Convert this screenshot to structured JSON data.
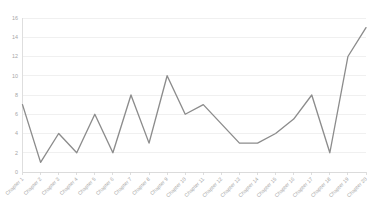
{
  "chart_data": {
    "type": "line",
    "title": "",
    "subtitle": "",
    "xlabel": "",
    "ylabel": "",
    "categories": [
      "Chapter 1",
      "Chapter 2",
      "Chapter 3",
      "Chapter 4",
      "Chapter 5",
      "Chapter 6",
      "Chapter 7",
      "Chapter 8",
      "Chapter 9",
      "Chapter 10",
      "Chapter 11",
      "Chapter 12",
      "Chapter 13",
      "Chapter 14",
      "Chapter 15",
      "Chapter 16",
      "Chapter 17",
      "Chapter 18",
      "Chapter 19",
      "Chapter 20"
    ],
    "values": [
      7,
      1,
      4,
      2,
      6,
      2,
      8,
      3,
      10,
      6,
      7,
      5,
      3,
      3,
      4,
      5.5,
      8,
      2,
      12,
      15
    ],
    "series": [
      {
        "name": "",
        "color": "#8c8c8c",
        "values": [
          7,
          1,
          4,
          2,
          6,
          2,
          8,
          3,
          10,
          6,
          7,
          5,
          3,
          3,
          4,
          5.5,
          8,
          2,
          12,
          15
        ]
      }
    ],
    "ylim": [
      0,
      16
    ],
    "ytick_values": [
      0,
      2,
      4,
      6,
      8,
      10,
      12,
      14,
      16
    ],
    "ytick_labels": [
      "0",
      "2",
      "4",
      "6",
      "8",
      "10",
      "12",
      "14",
      "16"
    ],
    "grid": true,
    "grid_axis": "y",
    "legend": false,
    "legend_position": "none",
    "markers": false,
    "xtick_rotation": -45,
    "colors": {
      "line": "#8c8c8c",
      "gridline": "#e9e9e9",
      "axis": "#d6d6d6",
      "tick_text": "#a6a6a6",
      "background": "#ffffff"
    }
  }
}
